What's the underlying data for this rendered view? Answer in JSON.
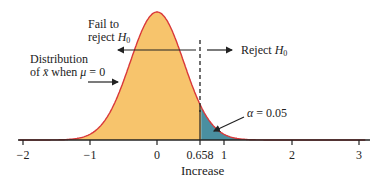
{
  "chart_data": {
    "type": "area",
    "title": "",
    "xlabel": "Increase",
    "ylabel": "",
    "xlim": [
      -2,
      3
    ],
    "x_ticks": [
      "−2",
      "−1",
      "0",
      "0.658",
      "1",
      "2",
      "3"
    ],
    "x_tick_values": [
      -2,
      -1,
      0,
      0.658,
      1,
      2,
      3
    ],
    "grid": false,
    "series": [
      {
        "name": "Distribution of x̄ when μ = 0",
        "distribution": "normal",
        "mean": 0,
        "sd": 0.4,
        "color": "#f7c46c",
        "line_color": "#d9383a"
      }
    ],
    "critical_value": 0.658,
    "rejection_region_color": "#4a8fa0",
    "annotations": {
      "fail_label_line1": "Fail to",
      "fail_label_line2": "reject ",
      "reject_label": "Reject ",
      "h0_letter": "H",
      "h0_sub": "0",
      "dist_line1": "Distribution",
      "dist_line2_pre": "of ",
      "dist_xbar": "x̄",
      "dist_when": " when ",
      "dist_mu": "μ",
      "dist_eq": " = 0",
      "alpha_symbol": "α",
      "alpha_value": " = 0.05"
    }
  }
}
